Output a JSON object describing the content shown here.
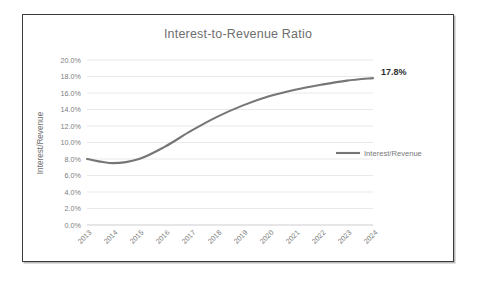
{
  "chart_data": {
    "type": "line",
    "title": "Interest-to-Revenue Ratio",
    "xlabel": "",
    "ylabel": "Interest/Revenue",
    "categories": [
      "2013",
      "2014",
      "2015",
      "2016",
      "2017",
      "2018",
      "2019",
      "2020",
      "2021",
      "2022",
      "2023",
      "2024"
    ],
    "series": [
      {
        "name": "Interest/Revenue",
        "values": [
          8.0,
          7.5,
          8.0,
          9.5,
          11.4,
          13.1,
          14.5,
          15.6,
          16.4,
          17.0,
          17.5,
          17.8
        ],
        "color": "#767676"
      }
    ],
    "ylim": [
      0.0,
      20.0
    ],
    "ytick_values": [
      0.0,
      2.0,
      4.0,
      6.0,
      8.0,
      10.0,
      12.0,
      14.0,
      16.0,
      18.0,
      20.0
    ],
    "ytick_labels": [
      "0.0%",
      "2.0%",
      "4.0%",
      "6.0%",
      "8.0%",
      "10.0%",
      "12.0%",
      "14.0%",
      "16.0%",
      "18.0%",
      "20.0%"
    ],
    "grid": true,
    "grid_axis": "y",
    "legend_position": "right",
    "legend_entries": [
      "Interest/Revenue"
    ],
    "annotations": [
      {
        "text": "17.8%",
        "category": "2024",
        "value": 17.8
      }
    ]
  },
  "frame": {
    "border_color": "#3a3a3c",
    "background": "#ffffff"
  }
}
